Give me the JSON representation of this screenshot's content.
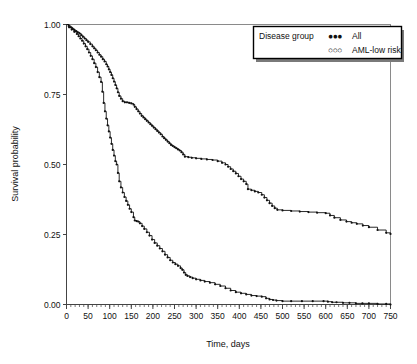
{
  "chart_data": {
    "type": "line",
    "title": "",
    "subtitle": "",
    "xlabel": "Time, days",
    "ylabel": "Survival probability",
    "xlim": [
      0,
      750
    ],
    "ylim": [
      0.0,
      1.0
    ],
    "grid": false,
    "legend_position": "top-right",
    "legend_title": "Disease group",
    "xticks": [
      0,
      50,
      100,
      150,
      200,
      250,
      300,
      350,
      400,
      450,
      500,
      550,
      600,
      650,
      700,
      750
    ],
    "xtick_labels": [
      "0",
      "50",
      "100",
      "150",
      "200",
      "250",
      "300",
      "350",
      "400",
      "450",
      "500",
      "550",
      "600",
      "650",
      "700",
      "750"
    ],
    "x_minor_tick_step": 10,
    "yticks": [
      0.0,
      0.25,
      0.5,
      0.75,
      1.0
    ],
    "ytick_labels": [
      "0.00",
      "0.25",
      "0.50",
      "0.75",
      "1.00"
    ],
    "series": [
      {
        "name": "All",
        "marker": "filled-circle",
        "marker_label": "●●●",
        "color": "#111111",
        "step": "post",
        "x": [
          0,
          5,
          10,
          14,
          18,
          22,
          26,
          30,
          34,
          38,
          42,
          46,
          50,
          55,
          60,
          64,
          68,
          72,
          76,
          80,
          84,
          88,
          92,
          95,
          98,
          101,
          104,
          107,
          110,
          113,
          116,
          119,
          122,
          126,
          130,
          135,
          140,
          145,
          150,
          155,
          158,
          162,
          166,
          170,
          174,
          178,
          182,
          186,
          190,
          194,
          198,
          202,
          206,
          210,
          214,
          218,
          222,
          226,
          230,
          234,
          238,
          242,
          246,
          250,
          254,
          258,
          262,
          266,
          270,
          274,
          282,
          290,
          300,
          312,
          325,
          338,
          350,
          360,
          368,
          374,
          380,
          386,
          392,
          398,
          404,
          410,
          416,
          420,
          428,
          436,
          444,
          452,
          458,
          464,
          470,
          476,
          482,
          488,
          500,
          520,
          540,
          560,
          580,
          600,
          610,
          620,
          634,
          648,
          660,
          672,
          686,
          700,
          720,
          740,
          750
        ],
        "y": [
          1.0,
          0.995,
          0.99,
          0.985,
          0.98,
          0.976,
          0.972,
          0.968,
          0.962,
          0.956,
          0.95,
          0.944,
          0.938,
          0.93,
          0.922,
          0.915,
          0.908,
          0.9,
          0.892,
          0.885,
          0.876,
          0.868,
          0.858,
          0.85,
          0.84,
          0.83,
          0.82,
          0.808,
          0.796,
          0.784,
          0.772,
          0.758,
          0.745,
          0.735,
          0.726,
          0.722,
          0.722,
          0.72,
          0.718,
          0.714,
          0.706,
          0.698,
          0.69,
          0.682,
          0.674,
          0.668,
          0.662,
          0.656,
          0.65,
          0.644,
          0.638,
          0.632,
          0.626,
          0.62,
          0.614,
          0.608,
          0.6,
          0.594,
          0.588,
          0.582,
          0.576,
          0.57,
          0.566,
          0.562,
          0.558,
          0.554,
          0.55,
          0.544,
          0.536,
          0.528,
          0.526,
          0.524,
          0.522,
          0.52,
          0.518,
          0.516,
          0.512,
          0.506,
          0.5,
          0.492,
          0.484,
          0.476,
          0.468,
          0.458,
          0.448,
          0.44,
          0.43,
          0.412,
          0.408,
          0.404,
          0.4,
          0.392,
          0.382,
          0.372,
          0.362,
          0.352,
          0.344,
          0.338,
          0.336,
          0.334,
          0.332,
          0.33,
          0.328,
          0.326,
          0.318,
          0.31,
          0.302,
          0.296,
          0.292,
          0.288,
          0.282,
          0.276,
          0.266,
          0.256,
          0.252
        ]
      },
      {
        "name": "AML-low risk",
        "marker": "open-circle",
        "marker_label": "○○○",
        "color": "#111111",
        "step": "post",
        "x": [
          0,
          6,
          12,
          18,
          24,
          28,
          32,
          36,
          40,
          44,
          48,
          52,
          56,
          60,
          64,
          68,
          72,
          76,
          80,
          83,
          86,
          89,
          92,
          95,
          98,
          101,
          104,
          107,
          110,
          113,
          116,
          119,
          122,
          126,
          130,
          134,
          138,
          142,
          146,
          150,
          155,
          158,
          162,
          166,
          170,
          175,
          180,
          186,
          192,
          198,
          204,
          210,
          216,
          222,
          228,
          234,
          240,
          246,
          252,
          258,
          264,
          268,
          272,
          276,
          280,
          286,
          292,
          300,
          310,
          320,
          332,
          344,
          356,
          368,
          380,
          392,
          404,
          416,
          428,
          440,
          452,
          462,
          470,
          478,
          486,
          500,
          520,
          545,
          570,
          595,
          605,
          615,
          625,
          640,
          655,
          670,
          685,
          700,
          720,
          740,
          750
        ],
        "y": [
          1.0,
          0.99,
          0.982,
          0.974,
          0.966,
          0.958,
          0.95,
          0.942,
          0.932,
          0.922,
          0.912,
          0.9,
          0.888,
          0.876,
          0.862,
          0.848,
          0.83,
          0.812,
          0.795,
          0.76,
          0.72,
          0.69,
          0.664,
          0.64,
          0.618,
          0.596,
          0.574,
          0.552,
          0.532,
          0.512,
          0.5,
          0.47,
          0.44,
          0.418,
          0.4,
          0.384,
          0.37,
          0.356,
          0.342,
          0.33,
          0.312,
          0.3,
          0.298,
          0.296,
          0.29,
          0.28,
          0.27,
          0.258,
          0.246,
          0.232,
          0.22,
          0.21,
          0.2,
          0.19,
          0.178,
          0.168,
          0.158,
          0.15,
          0.144,
          0.138,
          0.13,
          0.124,
          0.114,
          0.106,
          0.102,
          0.098,
          0.094,
          0.09,
          0.086,
          0.082,
          0.078,
          0.072,
          0.066,
          0.058,
          0.05,
          0.044,
          0.04,
          0.036,
          0.032,
          0.03,
          0.028,
          0.022,
          0.018,
          0.016,
          0.014,
          0.012,
          0.012,
          0.012,
          0.012,
          0.012,
          0.01,
          0.008,
          0.008,
          0.006,
          0.006,
          0.004,
          0.004,
          0.004,
          0.002,
          0.002,
          0.0
        ]
      }
    ]
  },
  "legend": {
    "title": "Disease group",
    "entries": [
      {
        "marker": "●●●",
        "label": "All"
      },
      {
        "marker": "○○○",
        "label": "AML-low risk"
      }
    ]
  },
  "colors": {
    "curve": "#111111",
    "axis": "#444444",
    "frame": "#8a8a8a",
    "background": "#ffffff"
  }
}
